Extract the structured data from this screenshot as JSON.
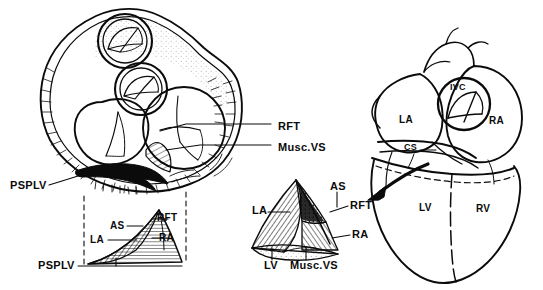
{
  "figure": {
    "kind": "anatomical-line-drawing",
    "background_color": "#ffffff",
    "ink_color": "#0b0b0b"
  },
  "panels": {
    "main_cross_section": {
      "name": "valve-plane-cross-section",
      "labels": [
        {
          "key": "rft",
          "text": "RFT",
          "x": 278,
          "y": 127
        },
        {
          "key": "musc_vs",
          "text": "Musc.VS",
          "x": 278,
          "y": 148
        },
        {
          "key": "psplv",
          "text": "PSPLV",
          "x": 10,
          "y": 186
        }
      ]
    },
    "left_inset": {
      "name": "left-triangle-inset",
      "labels": [
        {
          "key": "as",
          "text": "AS",
          "x": 110,
          "y": 227
        },
        {
          "key": "rft",
          "text": "RFT",
          "x": 155,
          "y": 222
        },
        {
          "key": "la",
          "text": "LA",
          "x": 93,
          "y": 242
        },
        {
          "key": "ra",
          "text": "RA",
          "x": 157,
          "y": 240
        },
        {
          "key": "psplv",
          "text": "PSPLV",
          "x": 40,
          "y": 266
        }
      ]
    },
    "middle_inset": {
      "name": "middle-triangle-inset",
      "labels": [
        {
          "key": "as",
          "text": "AS",
          "x": 331,
          "y": 186
        },
        {
          "key": "rft",
          "text": "RFT",
          "x": 355,
          "y": 205
        },
        {
          "key": "la",
          "text": "LA",
          "x": 254,
          "y": 210
        },
        {
          "key": "ra",
          "text": "RA",
          "x": 357,
          "y": 234
        },
        {
          "key": "lv",
          "text": "LV",
          "x": 265,
          "y": 264
        },
        {
          "key": "musc_vs",
          "text": "Musc.VS",
          "x": 292,
          "y": 265
        }
      ]
    },
    "heart_view": {
      "name": "whole-heart-posterior-view",
      "labels": [
        {
          "key": "ivc",
          "text": "IVC",
          "x": 450,
          "y": 88
        },
        {
          "key": "la",
          "text": "LA",
          "x": 400,
          "y": 120
        },
        {
          "key": "ra",
          "text": "RA",
          "x": 491,
          "y": 121
        },
        {
          "key": "cs",
          "text": "CS",
          "x": 405,
          "y": 148
        },
        {
          "key": "lv",
          "text": "LV",
          "x": 421,
          "y": 208
        },
        {
          "key": "rv",
          "text": "RV",
          "x": 478,
          "y": 210
        }
      ]
    }
  },
  "abbreviations": {
    "RFT": "right fibrous trigone",
    "Musc.VS": "muscular ventricular septum",
    "PSPLV": "posterior superior process of left ventricle",
    "AS": "atrial septum",
    "LA": "left atrium",
    "RA": "right atrium",
    "LV": "left ventricle",
    "RV": "right ventricle",
    "IVC": "inferior vena cava",
    "CS": "coronary sinus"
  }
}
